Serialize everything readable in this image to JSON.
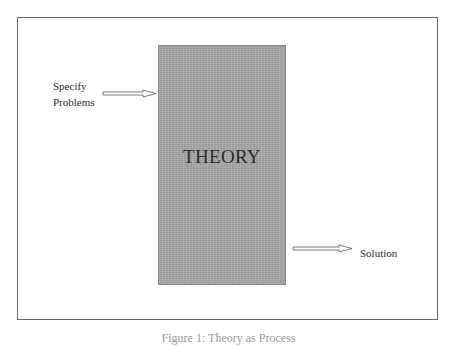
{
  "diagram": {
    "center_box": {
      "label": "THEORY",
      "fill": "#a9a9a9"
    },
    "input": {
      "lines": [
        "Specify",
        "Problems"
      ]
    },
    "output": {
      "label": "Solution"
    },
    "caption": "Figure 1: Theory as Process"
  }
}
